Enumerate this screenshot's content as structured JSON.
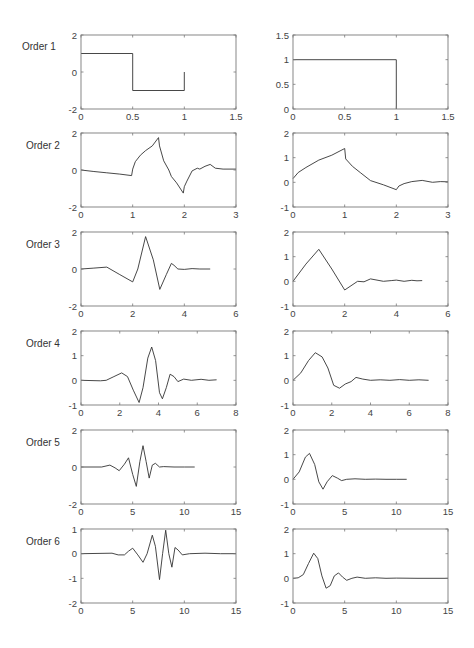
{
  "figure": {
    "row_labels": [
      "Order 1",
      "Order 2",
      "Order 3",
      "Order 4",
      "Order 5",
      "Order 6"
    ],
    "line_color": "#333333",
    "axis_color": "#7a7a7a"
  },
  "chart_data": [
    {
      "type": "line",
      "row": 1,
      "col": "left",
      "label": "Order 1",
      "title": "",
      "xlabel": "",
      "ylabel": "",
      "xlim": [
        0,
        1.5
      ],
      "ylim": [
        -2,
        2
      ],
      "xticks": [
        0,
        0.5,
        1,
        1.5
      ],
      "xticklabels": [
        "0",
        "0.5",
        "1",
        "1.5"
      ],
      "yticks": [
        -2,
        0,
        2
      ],
      "yticklabels": [
        "-2",
        "0",
        "2"
      ],
      "grid": false,
      "x": [
        0,
        0.5,
        0.5,
        1,
        1
      ],
      "y": [
        1,
        1,
        -1,
        -1,
        0
      ]
    },
    {
      "type": "line",
      "row": 1,
      "col": "right",
      "label": "Order 1",
      "title": "",
      "xlabel": "",
      "ylabel": "",
      "xlim": [
        0,
        1.5
      ],
      "ylim": [
        0,
        1.5
      ],
      "xticks": [
        0,
        0.5,
        1,
        1.5
      ],
      "xticklabels": [
        "0",
        "0.5",
        "1",
        "1.5"
      ],
      "yticks": [
        0,
        0.5,
        1,
        1.5
      ],
      "yticklabels": [
        "0",
        "0.5",
        "1",
        "1.5"
      ],
      "grid": false,
      "x": [
        0,
        1,
        1
      ],
      "y": [
        1,
        1,
        0
      ]
    },
    {
      "type": "line",
      "row": 2,
      "col": "left",
      "label": "Order 2",
      "title": "",
      "xlabel": "",
      "ylabel": "",
      "xlim": [
        0,
        3
      ],
      "ylim": [
        -2,
        2
      ],
      "xticks": [
        0,
        1,
        2,
        3
      ],
      "xticklabels": [
        "0",
        "1",
        "2",
        "3"
      ],
      "yticks": [
        -2,
        0,
        2
      ],
      "yticklabels": [
        "-2",
        "0",
        "2"
      ],
      "grid": false,
      "x": [
        0,
        0.25,
        0.5,
        0.75,
        0.98,
        1.0,
        1.05,
        1.15,
        1.25,
        1.38,
        1.5,
        1.52,
        1.6,
        1.7,
        1.75,
        1.85,
        1.98,
        2.0,
        2.05,
        2.15,
        2.25,
        2.3,
        2.4,
        2.5,
        2.6,
        2.75,
        3.0
      ],
      "y": [
        0.0,
        -0.08,
        -0.15,
        -0.22,
        -0.3,
        0.05,
        0.45,
        0.8,
        1.05,
        1.3,
        1.75,
        1.3,
        0.5,
        0.0,
        -0.35,
        -0.7,
        -1.25,
        -0.9,
        -0.6,
        -0.05,
        0.1,
        0.05,
        0.2,
        0.3,
        0.1,
        0.05,
        0.05
      ]
    },
    {
      "type": "line",
      "row": 2,
      "col": "right",
      "label": "Order 2",
      "title": "",
      "xlabel": "",
      "ylabel": "",
      "xlim": [
        0,
        3
      ],
      "ylim": [
        -1,
        2
      ],
      "xticks": [
        0,
        1,
        2,
        3
      ],
      "xticklabels": [
        "0",
        "1",
        "2",
        "3"
      ],
      "yticks": [
        -1,
        0,
        1,
        2
      ],
      "yticklabels": [
        "-1",
        "0",
        "1",
        "2"
      ],
      "grid": false,
      "x": [
        0,
        0.1,
        0.25,
        0.5,
        0.75,
        1.0,
        1.02,
        1.15,
        1.3,
        1.5,
        1.75,
        2.0,
        2.05,
        2.15,
        2.3,
        2.5,
        2.7,
        2.85,
        3.0
      ],
      "y": [
        0.15,
        0.4,
        0.6,
        0.9,
        1.1,
        1.37,
        0.95,
        0.65,
        0.4,
        0.07,
        -0.1,
        -0.3,
        -0.15,
        -0.05,
        0.03,
        0.08,
        0.0,
        0.03,
        0.02
      ]
    },
    {
      "type": "line",
      "row": 3,
      "col": "left",
      "label": "Order 3",
      "title": "",
      "xlabel": "",
      "ylabel": "",
      "xlim": [
        0,
        6
      ],
      "ylim": [
        -2,
        2
      ],
      "xticks": [
        0,
        2,
        4,
        6
      ],
      "xticklabels": [
        "0",
        "2",
        "4",
        "6"
      ],
      "yticks": [
        -2,
        0,
        2
      ],
      "yticklabels": [
        "-2",
        "0",
        "2"
      ],
      "grid": false,
      "x": [
        0,
        0.5,
        1.0,
        1.5,
        2.0,
        2.2,
        2.5,
        2.8,
        3.05,
        3.3,
        3.5,
        3.6,
        3.75,
        4.0,
        4.3,
        4.6,
        5.0
      ],
      "y": [
        0.0,
        0.05,
        0.1,
        -0.3,
        -0.7,
        0.0,
        1.75,
        0.5,
        -1.1,
        -0.3,
        0.3,
        0.2,
        0.0,
        -0.02,
        0.02,
        0.0,
        0.0
      ]
    },
    {
      "type": "line",
      "row": 3,
      "col": "right",
      "label": "Order 3",
      "title": "",
      "xlabel": "",
      "ylabel": "",
      "xlim": [
        0,
        6
      ],
      "ylim": [
        -1,
        2
      ],
      "xticks": [
        0,
        2,
        4,
        6
      ],
      "xticklabels": [
        "0",
        "2",
        "4",
        "6"
      ],
      "yticks": [
        -1,
        0,
        1,
        2
      ],
      "yticklabels": [
        "-1",
        "0",
        "1",
        "2"
      ],
      "grid": false,
      "x": [
        0,
        0.5,
        1.0,
        1.5,
        2.0,
        2.5,
        2.75,
        3.0,
        3.5,
        3.8,
        4.0,
        4.3,
        4.6,
        4.8,
        5.0
      ],
      "y": [
        0.0,
        0.7,
        1.3,
        0.5,
        -0.35,
        0.0,
        -0.02,
        0.1,
        0.0,
        0.03,
        0.05,
        0.0,
        0.04,
        0.02,
        0.03
      ]
    },
    {
      "type": "line",
      "row": 4,
      "col": "left",
      "label": "Order 4",
      "title": "",
      "xlabel": "",
      "ylabel": "",
      "xlim": [
        0,
        8
      ],
      "ylim": [
        -1,
        2
      ],
      "xticks": [
        0,
        2,
        4,
        6,
        8
      ],
      "xticklabels": [
        "0",
        "2",
        "4",
        "6",
        "8"
      ],
      "yticks": [
        -1,
        0,
        1,
        2
      ],
      "yticklabels": [
        "-1",
        "0",
        "1",
        "2"
      ],
      "grid": false,
      "x": [
        0,
        1.0,
        1.3,
        1.7,
        2.1,
        2.4,
        2.7,
        3.0,
        3.2,
        3.45,
        3.65,
        3.85,
        4.05,
        4.2,
        4.4,
        4.6,
        4.8,
        5.0,
        5.3,
        5.7,
        6.2,
        6.6,
        7.0
      ],
      "y": [
        0.0,
        -0.02,
        0.0,
        0.15,
        0.3,
        0.15,
        -0.4,
        -0.9,
        -0.3,
        0.9,
        1.35,
        0.8,
        -0.5,
        -0.75,
        -0.3,
        0.25,
        0.15,
        -0.05,
        0.05,
        0.0,
        0.04,
        0.0,
        0.02
      ]
    },
    {
      "type": "line",
      "row": 4,
      "col": "right",
      "label": "Order 4",
      "title": "",
      "xlabel": "",
      "ylabel": "",
      "xlim": [
        0,
        8
      ],
      "ylim": [
        -1,
        2
      ],
      "xticks": [
        0,
        2,
        4,
        6,
        8
      ],
      "xticklabels": [
        "0",
        "2",
        "4",
        "6",
        "8"
      ],
      "yticks": [
        -1,
        0,
        1,
        2
      ],
      "yticklabels": [
        "-1",
        "0",
        "1",
        "2"
      ],
      "grid": false,
      "x": [
        0,
        0.4,
        0.8,
        1.15,
        1.5,
        1.8,
        2.1,
        2.4,
        2.7,
        3.0,
        3.25,
        3.6,
        4.0,
        4.5,
        5.0,
        5.5,
        6.0,
        6.5,
        7.0
      ],
      "y": [
        0.0,
        0.3,
        0.8,
        1.12,
        0.95,
        0.5,
        -0.2,
        -0.32,
        -0.15,
        -0.05,
        0.12,
        0.05,
        0.0,
        0.02,
        0.0,
        0.03,
        0.0,
        0.02,
        0.0
      ]
    },
    {
      "type": "line",
      "row": 5,
      "col": "left",
      "label": "Order 5",
      "title": "",
      "xlabel": "",
      "ylabel": "",
      "xlim": [
        0,
        15
      ],
      "ylim": [
        -2,
        2
      ],
      "xticks": [
        0,
        5,
        10,
        15
      ],
      "xticklabels": [
        "0",
        "5",
        "10",
        "15"
      ],
      "yticks": [
        -2,
        0,
        2
      ],
      "yticklabels": [
        "-2",
        "0",
        "2"
      ],
      "grid": false,
      "x": [
        0,
        2.0,
        2.8,
        3.3,
        3.7,
        4.2,
        4.6,
        5.0,
        5.35,
        5.7,
        6.0,
        6.3,
        6.6,
        6.9,
        7.2,
        7.6,
        8.0,
        9.0,
        10.0,
        11.0
      ],
      "y": [
        0.0,
        0.0,
        0.1,
        -0.05,
        -0.2,
        0.15,
        0.5,
        -0.4,
        -1.05,
        0.3,
        1.15,
        0.3,
        -0.6,
        0.1,
        0.2,
        0.0,
        0.02,
        0.0,
        0.0,
        0.0
      ]
    },
    {
      "type": "line",
      "row": 5,
      "col": "right",
      "label": "Order 5",
      "title": "",
      "xlabel": "",
      "ylabel": "",
      "xlim": [
        0,
        15
      ],
      "ylim": [
        -1,
        2
      ],
      "xticks": [
        0,
        5,
        10,
        15
      ],
      "xticklabels": [
        "0",
        "5",
        "10",
        "15"
      ],
      "yticks": [
        -1,
        0,
        1,
        2
      ],
      "yticklabels": [
        "-1",
        "0",
        "1",
        "2"
      ],
      "grid": false,
      "x": [
        0,
        0.6,
        1.2,
        1.6,
        2.1,
        2.5,
        2.9,
        3.3,
        3.8,
        4.3,
        4.7,
        5.2,
        6.0,
        7.0,
        8.0,
        9.0,
        10.0,
        11.0
      ],
      "y": [
        0.0,
        0.3,
        0.9,
        1.05,
        0.6,
        -0.1,
        -0.4,
        -0.1,
        0.15,
        0.05,
        -0.05,
        0.0,
        0.02,
        0.0,
        0.01,
        0.0,
        0.0,
        0.0
      ]
    },
    {
      "type": "line",
      "row": 6,
      "col": "left",
      "label": "Order 6",
      "title": "",
      "xlabel": "",
      "ylabel": "",
      "xlim": [
        0,
        15
      ],
      "ylim": [
        -2,
        1
      ],
      "xticks": [
        0,
        5,
        10,
        15
      ],
      "xticklabels": [
        "0",
        "5",
        "10",
        "15"
      ],
      "yticks": [
        -2,
        -1,
        0,
        1
      ],
      "yticklabels": [
        "-2",
        "-1",
        "0",
        "1"
      ],
      "grid": false,
      "x": [
        0,
        3.0,
        3.6,
        4.2,
        4.6,
        5.0,
        5.5,
        6.0,
        6.4,
        6.9,
        7.2,
        7.6,
        7.9,
        8.2,
        8.5,
        8.8,
        9.1,
        9.4,
        9.8,
        10.5,
        12.0,
        13.5,
        15.0
      ],
      "y": [
        0.0,
        0.02,
        -0.05,
        -0.05,
        0.1,
        0.22,
        -0.05,
        -0.35,
        0.0,
        0.75,
        0.3,
        -1.05,
        0.0,
        0.95,
        0.0,
        -0.55,
        0.25,
        0.15,
        -0.05,
        0.0,
        0.02,
        0.0,
        0.0
      ]
    },
    {
      "type": "line",
      "row": 6,
      "col": "right",
      "label": "Order 6",
      "title": "",
      "xlabel": "",
      "ylabel": "",
      "xlim": [
        0,
        15
      ],
      "ylim": [
        -1,
        2
      ],
      "xticks": [
        0,
        5,
        10,
        15
      ],
      "xticklabels": [
        "0",
        "5",
        "10",
        "15"
      ],
      "yticks": [
        -1,
        0,
        1,
        2
      ],
      "yticklabels": [
        "-1",
        "0",
        "1",
        "2"
      ],
      "grid": false,
      "x": [
        0,
        0.5,
        1.0,
        1.5,
        2.0,
        2.4,
        2.8,
        3.2,
        3.6,
        4.0,
        4.4,
        4.8,
        5.2,
        5.7,
        6.2,
        7.0,
        8.0,
        9.0,
        10.0,
        12.0,
        15.0
      ],
      "y": [
        0.0,
        0.02,
        0.15,
        0.6,
        1.02,
        0.8,
        0.1,
        -0.4,
        -0.3,
        0.1,
        0.22,
        0.05,
        -0.08,
        0.0,
        0.05,
        0.0,
        0.02,
        0.0,
        0.01,
        0.0,
        0.0
      ]
    }
  ]
}
